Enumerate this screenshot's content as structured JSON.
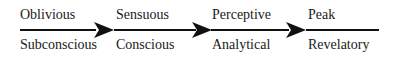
{
  "diagram": {
    "stages": [
      {
        "top": "Oblivious",
        "bottom": "Subconscious"
      },
      {
        "top": "Sensuous",
        "bottom": "Conscious"
      },
      {
        "top": "Perceptive",
        "bottom": "Analytical"
      },
      {
        "top": "Peak",
        "bottom": "Revelatory"
      }
    ]
  }
}
